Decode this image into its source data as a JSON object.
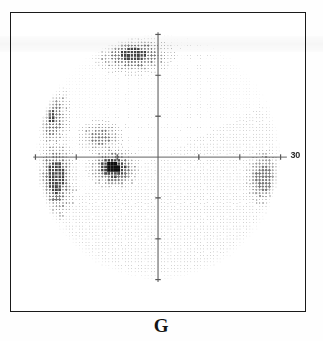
{
  "figure": {
    "caption": "G",
    "type": "visual-field-grayscale-plot",
    "axis_degree_label": "30"
  },
  "colors": {
    "frame": "#1a1a1a",
    "axis": "#595959",
    "background": "#ffffff",
    "dot_light": "#c8c8c8",
    "dot_mid": "#8c8c8c",
    "dot_dark": "#3a3a3a",
    "dot_black": "#0d0d0d"
  },
  "chart_data": {
    "type": "heatmap",
    "title": "G",
    "subtitle": "",
    "xlabel": "",
    "ylabel": "",
    "xlim": [
      -30,
      30
    ],
    "ylim": [
      -30,
      30
    ],
    "grid": false,
    "legend": "none",
    "axis_labels": [
      "30"
    ],
    "x_ticks": [
      -30,
      -20,
      -10,
      0,
      10,
      20,
      30
    ],
    "y_ticks": [
      -30,
      -20,
      -10,
      0,
      10,
      20,
      30
    ],
    "field_radius_deg": 30,
    "defect_regions": [
      {
        "name": "superior-nasal-dense-scotoma",
        "cx_deg": -6,
        "cy_deg": 25,
        "rx_deg": 8,
        "ry_deg": 4,
        "severity": 0.8
      },
      {
        "name": "superior-temporal-edge-arc",
        "cx_deg": -26,
        "cy_deg": 10,
        "rx_deg": 4,
        "ry_deg": 7,
        "severity": 0.72
      },
      {
        "name": "paracentral-superior-cluster",
        "cx_deg": -14,
        "cy_deg": 5,
        "rx_deg": 5,
        "ry_deg": 3.5,
        "severity": 0.62
      },
      {
        "name": "central-dense-absolute-scotoma",
        "cx_deg": -11,
        "cy_deg": -2.5,
        "rx_deg": 5,
        "ry_deg": 4,
        "severity": 1.0
      },
      {
        "name": "nasal-step-inferior-band",
        "cx_deg": -25,
        "cy_deg": -5,
        "rx_deg": 4,
        "ry_deg": 8,
        "severity": 0.88
      },
      {
        "name": "temporal-edge-inferior-patch",
        "cx_deg": 26,
        "cy_deg": -5,
        "rx_deg": 4,
        "ry_deg": 6,
        "severity": 0.6
      }
    ],
    "greyscale_levels": [
      {
        "label": "normal",
        "gray": "#d2d2d2"
      },
      {
        "label": "mild",
        "gray": "#a8a8a8"
      },
      {
        "label": "moderate",
        "gray": "#787878"
      },
      {
        "label": "severe",
        "gray": "#3f3f3f"
      },
      {
        "label": "absolute",
        "gray": "#0d0d0d"
      }
    ]
  }
}
